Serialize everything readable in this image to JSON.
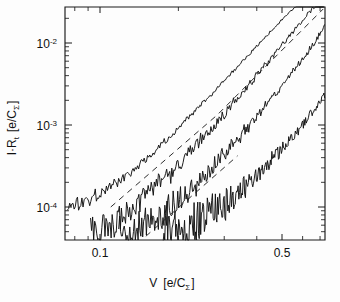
{
  "chart_data": {
    "type": "line",
    "title": "",
    "xlabel": "V [e/C_Σ]",
    "ylabel": "I·R_t [e/C_Σ]",
    "xscale": "log",
    "yscale": "log",
    "xlim": [
      0.07,
      0.78
    ],
    "ylim": [
      3.5e-05,
      0.045
    ],
    "grid": false,
    "legend": null,
    "xticklabels": [
      "0.1",
      "0.5"
    ],
    "xtickvalues": [
      0.1,
      0.5
    ],
    "yticklabels": [
      "10-2",
      "10-3",
      "10-4"
    ],
    "ytickvalues": [
      0.01,
      0.001,
      0.0001
    ],
    "ytick_mantissa": "10",
    "ytick_exponents": [
      "-2",
      "-3",
      "-4"
    ],
    "xlabel_main": "V",
    "xlabel_bracket_open": "[e/C",
    "xlabel_sub": "Σ",
    "xlabel_bracket_close": "]",
    "ylabel_main": "I·R",
    "ylabel_sub1": "t",
    "ylabel_bracket_open": "[e/C",
    "ylabel_sub2": "Σ",
    "ylabel_bracket_close": "]",
    "series": [
      {
        "name": "curve-1-topmost",
        "style": "solid",
        "noise": 0.055,
        "points_xy": [
          [
            0.075,
            0.000105
          ],
          [
            0.082,
            0.00011
          ],
          [
            0.09,
            0.000125
          ],
          [
            0.098,
            0.000145
          ],
          [
            0.107,
            0.00017
          ],
          [
            0.117,
            0.000205
          ],
          [
            0.128,
            0.000255
          ],
          [
            0.14,
            0.00032
          ],
          [
            0.153,
            0.00041
          ],
          [
            0.168,
            0.00054
          ],
          [
            0.184,
            0.00071
          ],
          [
            0.201,
            0.00094
          ],
          [
            0.22,
            0.00125
          ],
          [
            0.241,
            0.00168
          ],
          [
            0.264,
            0.00225
          ],
          [
            0.289,
            0.00305
          ],
          [
            0.317,
            0.00415
          ],
          [
            0.347,
            0.00565
          ],
          [
            0.38,
            0.0077
          ],
          [
            0.416,
            0.0105
          ],
          [
            0.456,
            0.0142
          ],
          [
            0.5,
            0.0192
          ],
          [
            0.548,
            0.0255
          ],
          [
            0.6,
            0.032
          ],
          [
            0.657,
            0.038
          ],
          [
            0.72,
            0.041
          ]
        ]
      },
      {
        "name": "curve-2",
        "style": "solid",
        "noise": 0.13,
        "points_xy": [
          [
            0.092,
            5.2e-05
          ],
          [
            0.1,
            5.6e-05
          ],
          [
            0.109,
            6.4e-05
          ],
          [
            0.119,
            7.6e-05
          ],
          [
            0.13,
            9.2e-05
          ],
          [
            0.142,
            0.000115
          ],
          [
            0.155,
            0.000147
          ],
          [
            0.17,
            0.000192
          ],
          [
            0.186,
            0.000255
          ],
          [
            0.203,
            0.000345
          ],
          [
            0.222,
            0.00047
          ],
          [
            0.243,
            0.000645
          ],
          [
            0.266,
            0.00089
          ],
          [
            0.291,
            0.00123
          ],
          [
            0.318,
            0.00172
          ],
          [
            0.348,
            0.0024
          ],
          [
            0.381,
            0.00335
          ],
          [
            0.417,
            0.0047
          ],
          [
            0.456,
            0.0066
          ],
          [
            0.499,
            0.0093
          ],
          [
            0.546,
            0.0131
          ],
          [
            0.598,
            0.0185
          ],
          [
            0.654,
            0.026
          ],
          [
            0.716,
            0.036
          ],
          [
            0.745,
            0.0405
          ]
        ]
      },
      {
        "name": "curve-3",
        "style": "solid",
        "noise": 0.17,
        "points_xy": [
          [
            0.118,
            4.2e-05
          ],
          [
            0.128,
            4.6e-05
          ],
          [
            0.139,
            5.2e-05
          ],
          [
            0.151,
            6.1e-05
          ],
          [
            0.164,
            7.3e-05
          ],
          [
            0.178,
            8.9e-05
          ],
          [
            0.194,
            0.000111
          ],
          [
            0.211,
            0.00014
          ],
          [
            0.229,
            0.00018
          ],
          [
            0.249,
            0.000235
          ],
          [
            0.271,
            0.00031
          ],
          [
            0.295,
            0.000415
          ],
          [
            0.321,
            0.00056
          ],
          [
            0.349,
            0.00076
          ],
          [
            0.38,
            0.00104
          ],
          [
            0.413,
            0.00143
          ],
          [
            0.449,
            0.00198
          ],
          [
            0.489,
            0.00276
          ],
          [
            0.532,
            0.00388
          ],
          [
            0.579,
            0.0055
          ],
          [
            0.63,
            0.0079
          ],
          [
            0.685,
            0.0116
          ],
          [
            0.745,
            0.0175
          ],
          [
            0.77,
            0.021
          ]
        ]
      },
      {
        "name": "curve-4-lowest",
        "style": "solid",
        "noise": 0.24,
        "points_xy": [
          [
            0.175,
            4e-05
          ],
          [
            0.189,
            4.35e-05
          ],
          [
            0.204,
            4.85e-05
          ],
          [
            0.22,
            5.5e-05
          ],
          [
            0.238,
            6.35e-05
          ],
          [
            0.257,
            7.45e-05
          ],
          [
            0.277,
            8.85e-05
          ],
          [
            0.299,
            0.000107
          ],
          [
            0.323,
            0.000131
          ],
          [
            0.349,
            0.000162
          ],
          [
            0.377,
            0.000203
          ],
          [
            0.407,
            0.000257
          ],
          [
            0.44,
            0.00033
          ],
          [
            0.475,
            0.000428
          ],
          [
            0.513,
            0.00056
          ],
          [
            0.554,
            0.000745
          ],
          [
            0.598,
            0.001
          ],
          [
            0.646,
            0.00137
          ],
          [
            0.698,
            0.00192
          ],
          [
            0.754,
            0.00275
          ],
          [
            0.778,
            0.0032
          ]
        ]
      },
      {
        "name": "fit-dashed-1",
        "style": "dashed",
        "noise": 0,
        "points_xy": [
          [
            0.11,
            0.0001
          ],
          [
            0.2,
            0.00051
          ],
          [
            0.3,
            0.00155
          ],
          [
            0.42,
            0.0041
          ],
          [
            0.56,
            0.0103
          ],
          [
            0.72,
            0.026
          ]
        ]
      },
      {
        "name": "fit-dashed-2",
        "style": "dashed",
        "noise": 0,
        "points_xy": [
          [
            0.15,
            4.4e-05
          ],
          [
            0.23,
            0.000135
          ],
          [
            0.33,
            0.00039
          ],
          [
            0.45,
            0.0011
          ],
          [
            0.6,
            0.0031
          ],
          [
            0.76,
            0.0078
          ]
        ]
      }
    ]
  }
}
